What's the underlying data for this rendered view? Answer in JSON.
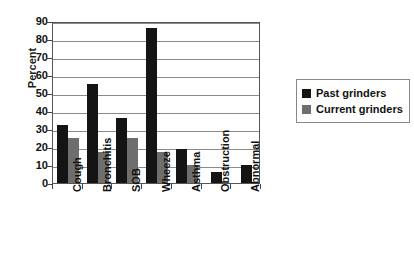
{
  "chart_data": {
    "type": "bar",
    "title": "",
    "xlabel": "",
    "ylabel": "Percent",
    "ylim": [
      0,
      90
    ],
    "ytick_step": 10,
    "yticks": [
      90,
      80,
      70,
      60,
      50,
      40,
      30,
      20,
      10,
      0
    ],
    "grid": true,
    "legend_position": "right",
    "categories": [
      "Cough",
      "Bronchitis",
      "SOB",
      "Wheeze",
      "Asthma",
      "Obstruction",
      "Abnormal"
    ],
    "series": [
      {
        "name": "Past grinders",
        "color": "#141414",
        "values": [
          32,
          55,
          36,
          86,
          19,
          6,
          10
        ]
      },
      {
        "name": "Current grinders",
        "color": "#6e6e6e",
        "values": [
          25,
          17,
          25,
          17,
          10,
          0,
          0
        ]
      }
    ]
  },
  "legend": {
    "entries": [
      {
        "label": "Past grinders"
      },
      {
        "label": "Current grinders"
      }
    ]
  }
}
